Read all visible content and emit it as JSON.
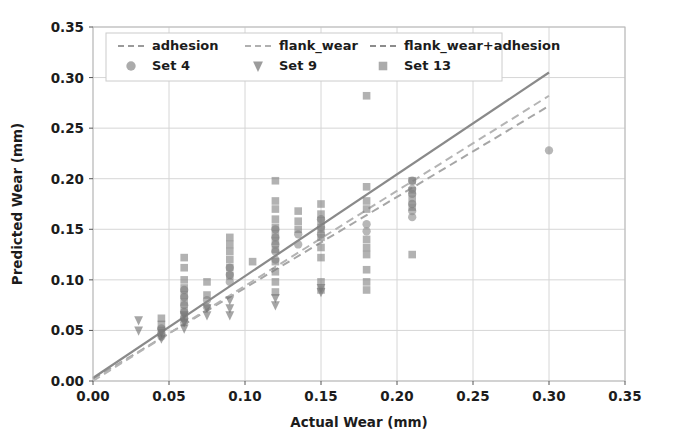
{
  "chart_data": {
    "type": "scatter",
    "title": "",
    "xlabel": "Actual Wear (mm)",
    "ylabel": "Predicted Wear (mm)",
    "xlim": [
      0.0,
      0.35
    ],
    "ylim": [
      0.0,
      0.35
    ],
    "xticks": [
      "0.00",
      "0.05",
      "0.10",
      "0.15",
      "0.20",
      "0.25",
      "0.30",
      "0.35"
    ],
    "yticks": [
      "0.00",
      "0.05",
      "0.10",
      "0.15",
      "0.20",
      "0.25",
      "0.30",
      "0.35"
    ],
    "xtick_values": [
      0.0,
      0.05,
      0.1,
      0.15,
      0.2,
      0.25,
      0.3,
      0.35
    ],
    "ytick_values": [
      0.0,
      0.05,
      0.1,
      0.15,
      0.2,
      0.25,
      0.3,
      0.35
    ],
    "grid": true,
    "legend_position": "upper-left",
    "legend": [
      {
        "label": "adhesion",
        "kind": "line",
        "style": "dashed",
        "color": "#9a9a9a"
      },
      {
        "label": "flank_wear",
        "kind": "line",
        "style": "dashed",
        "color": "#b0b0b0"
      },
      {
        "label": "flank_wear+adhesion",
        "kind": "line",
        "style": "dashed",
        "color": "#8c8c8c"
      },
      {
        "label": "Set 4",
        "kind": "marker",
        "marker": "circle",
        "color": "#777777"
      },
      {
        "label": "Set 9",
        "kind": "marker",
        "marker": "triangle-down",
        "color": "#5f5f5f"
      },
      {
        "label": "Set 13",
        "kind": "marker",
        "marker": "square",
        "color": "#6e6e6e"
      }
    ],
    "lines": [
      {
        "name": "adhesion",
        "style": "dashed",
        "color": "#a6a6a6",
        "width": 2.0,
        "x": [
          0.0,
          0.3
        ],
        "y": [
          0.002,
          0.272
        ]
      },
      {
        "name": "flank_wear",
        "style": "dashed",
        "color": "#b4b4b4",
        "width": 2.0,
        "x": [
          0.0,
          0.3
        ],
        "y": [
          0.0,
          0.282
        ]
      },
      {
        "name": "flank_wear+adhesion",
        "style": "solid",
        "color": "#8a8a8a",
        "width": 2.2,
        "x": [
          0.0,
          0.3
        ],
        "y": [
          0.003,
          0.305
        ]
      }
    ],
    "series": [
      {
        "name": "Set 4",
        "marker": "circle",
        "color": "#8a8a8a",
        "points": [
          [
            0.045,
            0.047
          ],
          [
            0.045,
            0.052
          ],
          [
            0.045,
            0.044
          ],
          [
            0.06,
            0.075
          ],
          [
            0.06,
            0.068
          ],
          [
            0.06,
            0.062
          ],
          [
            0.06,
            0.058
          ],
          [
            0.06,
            0.083
          ],
          [
            0.06,
            0.09
          ],
          [
            0.075,
            0.08
          ],
          [
            0.075,
            0.073
          ],
          [
            0.09,
            0.105
          ],
          [
            0.09,
            0.112
          ],
          [
            0.09,
            0.098
          ],
          [
            0.12,
            0.135
          ],
          [
            0.12,
            0.128
          ],
          [
            0.12,
            0.142
          ],
          [
            0.12,
            0.15
          ],
          [
            0.12,
            0.12
          ],
          [
            0.135,
            0.145
          ],
          [
            0.135,
            0.135
          ],
          [
            0.15,
            0.16
          ],
          [
            0.15,
            0.152
          ],
          [
            0.15,
            0.145
          ],
          [
            0.18,
            0.155
          ],
          [
            0.18,
            0.148
          ],
          [
            0.21,
            0.198
          ],
          [
            0.21,
            0.19
          ],
          [
            0.21,
            0.185
          ],
          [
            0.21,
            0.175
          ],
          [
            0.21,
            0.168
          ],
          [
            0.21,
            0.162
          ],
          [
            0.3,
            0.228
          ]
        ]
      },
      {
        "name": "Set 9",
        "marker": "triangle-down",
        "color": "#6d6d6d",
        "points": [
          [
            0.03,
            0.06
          ],
          [
            0.03,
            0.05
          ],
          [
            0.045,
            0.048
          ],
          [
            0.045,
            0.042
          ],
          [
            0.06,
            0.058
          ],
          [
            0.06,
            0.052
          ],
          [
            0.06,
            0.065
          ],
          [
            0.075,
            0.072
          ],
          [
            0.075,
            0.065
          ],
          [
            0.09,
            0.072
          ],
          [
            0.09,
            0.065
          ],
          [
            0.09,
            0.08
          ],
          [
            0.12,
            0.082
          ],
          [
            0.12,
            0.075
          ],
          [
            0.15,
            0.092
          ],
          [
            0.15,
            0.088
          ]
        ]
      },
      {
        "name": "Set 13",
        "marker": "square",
        "color": "#7a7a7a",
        "points": [
          [
            0.045,
            0.05
          ],
          [
            0.045,
            0.056
          ],
          [
            0.045,
            0.062
          ],
          [
            0.06,
            0.122
          ],
          [
            0.06,
            0.112
          ],
          [
            0.06,
            0.1
          ],
          [
            0.06,
            0.092
          ],
          [
            0.06,
            0.085
          ],
          [
            0.06,
            0.078
          ],
          [
            0.06,
            0.07
          ],
          [
            0.06,
            0.063
          ],
          [
            0.075,
            0.098
          ],
          [
            0.075,
            0.085
          ],
          [
            0.09,
            0.142
          ],
          [
            0.09,
            0.135
          ],
          [
            0.09,
            0.128
          ],
          [
            0.09,
            0.12
          ],
          [
            0.09,
            0.112
          ],
          [
            0.09,
            0.104
          ],
          [
            0.105,
            0.118
          ],
          [
            0.12,
            0.198
          ],
          [
            0.12,
            0.178
          ],
          [
            0.12,
            0.17
          ],
          [
            0.12,
            0.16
          ],
          [
            0.12,
            0.152
          ],
          [
            0.12,
            0.145
          ],
          [
            0.12,
            0.138
          ],
          [
            0.12,
            0.13
          ],
          [
            0.12,
            0.118
          ],
          [
            0.12,
            0.108
          ],
          [
            0.12,
            0.098
          ],
          [
            0.12,
            0.088
          ],
          [
            0.135,
            0.168
          ],
          [
            0.135,
            0.158
          ],
          [
            0.135,
            0.15
          ],
          [
            0.15,
            0.175
          ],
          [
            0.15,
            0.165
          ],
          [
            0.15,
            0.158
          ],
          [
            0.15,
            0.15
          ],
          [
            0.15,
            0.142
          ],
          [
            0.15,
            0.132
          ],
          [
            0.15,
            0.122
          ],
          [
            0.15,
            0.098
          ],
          [
            0.15,
            0.09
          ],
          [
            0.18,
            0.282
          ],
          [
            0.18,
            0.192
          ],
          [
            0.18,
            0.178
          ],
          [
            0.18,
            0.17
          ],
          [
            0.18,
            0.14
          ],
          [
            0.18,
            0.132
          ],
          [
            0.18,
            0.125
          ],
          [
            0.18,
            0.11
          ],
          [
            0.18,
            0.098
          ],
          [
            0.18,
            0.09
          ],
          [
            0.21,
            0.198
          ],
          [
            0.21,
            0.188
          ],
          [
            0.21,
            0.18
          ],
          [
            0.21,
            0.172
          ],
          [
            0.21,
            0.125
          ]
        ]
      }
    ]
  }
}
